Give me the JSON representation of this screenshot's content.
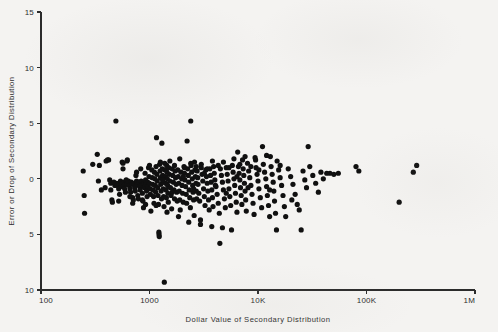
{
  "figure": {
    "background_color": "#f4f3f1",
    "ink_color": "#101010"
  },
  "chart_data": {
    "type": "scatter",
    "title": "",
    "xlabel": "Dollar Value of Secondary Distribution",
    "ylabel": "Error or Drop of Secondary Distribution",
    "xscale": "log",
    "yscale": "linear",
    "xlim": [
      100,
      1000000
    ],
    "ylim": [
      -10,
      15
    ],
    "grid": false,
    "legend": null,
    "xtick_labels": [
      "100",
      "1000",
      "10K",
      "100K",
      "1M"
    ],
    "xtick_values": [
      100,
      1000,
      10000,
      100000,
      1000000
    ],
    "ytick_labels": [
      "15",
      "10",
      "5",
      "0",
      "5",
      "10"
    ],
    "ytick_values": [
      15,
      10,
      5,
      0,
      -5,
      -10
    ],
    "marker": "filled-circle",
    "marker_size_px": 2.6,
    "n_points": 331,
    "points": [
      [
        245,
        0.7
      ],
      [
        250,
        -1.5
      ],
      [
        252,
        -3.1
      ],
      [
        330,
        2.2
      ],
      [
        338,
        -0.2
      ],
      [
        345,
        1.2
      ],
      [
        360,
        -1.0
      ],
      [
        398,
        1.6
      ],
      [
        410,
        1.7
      ],
      [
        420,
        1.7
      ],
      [
        430,
        -0.1
      ],
      [
        440,
        -0.4
      ],
      [
        450,
        -1.9
      ],
      [
        455,
        -2.1
      ],
      [
        470,
        -0.3
      ],
      [
        480,
        -0.6
      ],
      [
        490,
        5.2
      ],
      [
        500,
        -0.4
      ],
      [
        510,
        -0.6
      ],
      [
        520,
        -0.9
      ],
      [
        530,
        -1.4
      ],
      [
        540,
        -0.2
      ],
      [
        545,
        -0.5
      ],
      [
        550,
        -0.7
      ],
      [
        560,
        1.5
      ],
      [
        570,
        1.4
      ],
      [
        580,
        -0.3
      ],
      [
        585,
        -0.6
      ],
      [
        590,
        -0.9
      ],
      [
        600,
        -1.2
      ],
      [
        610,
        -0.1
      ],
      [
        615,
        -0.5
      ],
      [
        620,
        1.6
      ],
      [
        625,
        1.7
      ],
      [
        640,
        -0.2
      ],
      [
        650,
        -0.6
      ],
      [
        660,
        -0.9
      ],
      [
        670,
        -1.2
      ],
      [
        680,
        -0.3
      ],
      [
        690,
        -0.5
      ],
      [
        700,
        -1.7
      ],
      [
        710,
        -1.9
      ],
      [
        720,
        -0.4
      ],
      [
        730,
        -0.8
      ],
      [
        740,
        -1.1
      ],
      [
        750,
        0.3
      ],
      [
        760,
        -0.2
      ],
      [
        770,
        -0.5
      ],
      [
        780,
        -1.5
      ],
      [
        790,
        -1.8
      ],
      [
        800,
        -0.3
      ],
      [
        810,
        -0.7
      ],
      [
        820,
        -1.0
      ],
      [
        830,
        0.9
      ],
      [
        840,
        -0.2
      ],
      [
        850,
        -0.6
      ],
      [
        860,
        -1.3
      ],
      [
        870,
        -2.0
      ],
      [
        880,
        -2.6
      ],
      [
        890,
        -0.4
      ],
      [
        900,
        -0.8
      ],
      [
        910,
        0.5
      ],
      [
        920,
        -0.1
      ],
      [
        930,
        -0.5
      ],
      [
        940,
        -1.1
      ],
      [
        950,
        -1.6
      ],
      [
        960,
        -0.3
      ],
      [
        970,
        -0.7
      ],
      [
        980,
        1.0
      ],
      [
        990,
        0.2
      ],
      [
        1000,
        -0.4
      ],
      [
        1010,
        -0.9
      ],
      [
        1020,
        -1.4
      ],
      [
        1030,
        -2.9
      ],
      [
        1050,
        0.8
      ],
      [
        1060,
        0.1
      ],
      [
        1070,
        -0.5
      ],
      [
        1080,
        -1.0
      ],
      [
        1090,
        -1.6
      ],
      [
        1100,
        -2.2
      ],
      [
        1110,
        0.6
      ],
      [
        1120,
        0.0
      ],
      [
        1130,
        -0.6
      ],
      [
        1140,
        -1.2
      ],
      [
        1150,
        1.1
      ],
      [
        1160,
        3.7
      ],
      [
        1170,
        0.4
      ],
      [
        1180,
        -0.2
      ],
      [
        1190,
        -0.8
      ],
      [
        1200,
        -1.5
      ],
      [
        1210,
        -2.3
      ],
      [
        1220,
        -4.8
      ],
      [
        1225,
        -5.0
      ],
      [
        1230,
        -5.2
      ],
      [
        1240,
        1.3
      ],
      [
        1250,
        0.7
      ],
      [
        1260,
        0.1
      ],
      [
        1270,
        -0.5
      ],
      [
        1280,
        -1.1
      ],
      [
        1290,
        -1.8
      ],
      [
        1300,
        3.2
      ],
      [
        1310,
        0.9
      ],
      [
        1320,
        0.3
      ],
      [
        1330,
        -0.3
      ],
      [
        1340,
        -0.9
      ],
      [
        1350,
        -1.6
      ],
      [
        1360,
        -2.5
      ],
      [
        1370,
        -9.3
      ],
      [
        1380,
        1.4
      ],
      [
        1390,
        0.8
      ],
      [
        1400,
        0.2
      ],
      [
        1410,
        -0.4
      ],
      [
        1420,
        -1.0
      ],
      [
        1430,
        -1.7
      ],
      [
        1440,
        1.2
      ],
      [
        1450,
        0.6
      ],
      [
        1460,
        0.0
      ],
      [
        1470,
        -0.6
      ],
      [
        1480,
        -1.3
      ],
      [
        1490,
        -2.1
      ],
      [
        1500,
        1.0
      ],
      [
        1520,
        0.4
      ],
      [
        1540,
        -0.2
      ],
      [
        1560,
        -0.8
      ],
      [
        1580,
        -1.5
      ],
      [
        1600,
        -2.7
      ],
      [
        1620,
        0.9
      ],
      [
        1640,
        0.3
      ],
      [
        1660,
        -0.3
      ],
      [
        1680,
        -1.0
      ],
      [
        1700,
        -1.8
      ],
      [
        1720,
        0.7
      ],
      [
        1740,
        0.1
      ],
      [
        1760,
        -0.5
      ],
      [
        1780,
        -1.2
      ],
      [
        1800,
        -2.0
      ],
      [
        1820,
        0.8
      ],
      [
        1840,
        0.2
      ],
      [
        1860,
        -0.4
      ],
      [
        1880,
        -1.1
      ],
      [
        1900,
        -1.9
      ],
      [
        1920,
        -2.8
      ],
      [
        1950,
        0.6
      ],
      [
        1980,
        0.0
      ],
      [
        2000,
        -0.6
      ],
      [
        2020,
        -1.3
      ],
      [
        2050,
        -2.1
      ],
      [
        2080,
        1.1
      ],
      [
        2100,
        0.5
      ],
      [
        2120,
        -0.1
      ],
      [
        2150,
        -0.7
      ],
      [
        2180,
        -1.4
      ],
      [
        2200,
        -2.2
      ],
      [
        2220,
        3.4
      ],
      [
        2250,
        0.9
      ],
      [
        2280,
        0.3
      ],
      [
        2300,
        -0.3
      ],
      [
        2320,
        -1.0
      ],
      [
        2350,
        -1.7
      ],
      [
        2380,
        -2.6
      ],
      [
        2400,
        5.2
      ],
      [
        2420,
        1.2
      ],
      [
        2450,
        0.6
      ],
      [
        2480,
        0.0
      ],
      [
        2500,
        -0.6
      ],
      [
        2520,
        -1.2
      ],
      [
        2550,
        -1.9
      ],
      [
        2580,
        -3.3
      ],
      [
        2600,
        1.5
      ],
      [
        2620,
        0.8
      ],
      [
        2650,
        0.2
      ],
      [
        2680,
        -0.4
      ],
      [
        2700,
        -1.1
      ],
      [
        2720,
        -1.8
      ],
      [
        2750,
        0.7
      ],
      [
        2780,
        0.1
      ],
      [
        2800,
        -0.5
      ],
      [
        2850,
        -1.3
      ],
      [
        2900,
        -2.0
      ],
      [
        2950,
        -3.7
      ],
      [
        3000,
        1.0
      ],
      [
        3050,
        0.4
      ],
      [
        3100,
        -0.2
      ],
      [
        3150,
        -0.9
      ],
      [
        3200,
        -1.6
      ],
      [
        3250,
        -2.4
      ],
      [
        3300,
        0.8
      ],
      [
        3350,
        0.2
      ],
      [
        3400,
        -0.4
      ],
      [
        3450,
        -1.1
      ],
      [
        3500,
        -1.9
      ],
      [
        3550,
        -2.8
      ],
      [
        3600,
        0.9
      ],
      [
        3650,
        0.3
      ],
      [
        3700,
        -0.3
      ],
      [
        3750,
        -1.0
      ],
      [
        3800,
        -1.7
      ],
      [
        3850,
        -2.5
      ],
      [
        3900,
        1.1
      ],
      [
        3950,
        0.5
      ],
      [
        4000,
        -0.1
      ],
      [
        4100,
        -0.7
      ],
      [
        4200,
        -1.4
      ],
      [
        4300,
        -2.2
      ],
      [
        4400,
        -3.1
      ],
      [
        4450,
        -5.8
      ],
      [
        4500,
        0.9
      ],
      [
        4600,
        0.3
      ],
      [
        4700,
        -0.3
      ],
      [
        4800,
        -1.0
      ],
      [
        4900,
        -1.8
      ],
      [
        5000,
        -2.6
      ],
      [
        5100,
        1.0
      ],
      [
        5200,
        0.4
      ],
      [
        5300,
        -0.2
      ],
      [
        5400,
        -0.9
      ],
      [
        5500,
        -1.6
      ],
      [
        5600,
        -2.4
      ],
      [
        5700,
        -4.6
      ],
      [
        5800,
        1.2
      ],
      [
        5900,
        0.6
      ],
      [
        6000,
        0.0
      ],
      [
        6100,
        -0.6
      ],
      [
        6200,
        -1.3
      ],
      [
        6300,
        -2.1
      ],
      [
        6400,
        -3.0
      ],
      [
        6500,
        2.4
      ],
      [
        6600,
        1.1
      ],
      [
        6700,
        0.5
      ],
      [
        6800,
        -0.1
      ],
      [
        6900,
        -0.8
      ],
      [
        7000,
        -1.5
      ],
      [
        7100,
        -2.3
      ],
      [
        7200,
        1.7
      ],
      [
        7300,
        0.9
      ],
      [
        7400,
        0.3
      ],
      [
        7500,
        -0.4
      ],
      [
        7600,
        -1.1
      ],
      [
        7700,
        -1.9
      ],
      [
        7800,
        -2.9
      ],
      [
        8000,
        1.4
      ],
      [
        8200,
        0.7
      ],
      [
        8400,
        0.1
      ],
      [
        8600,
        -0.6
      ],
      [
        8800,
        -1.4
      ],
      [
        9000,
        -2.2
      ],
      [
        9200,
        -3.2
      ],
      [
        9400,
        1.9
      ],
      [
        9600,
        1.0
      ],
      [
        9800,
        0.4
      ],
      [
        10000,
        -0.2
      ],
      [
        10200,
        -0.9
      ],
      [
        10500,
        -1.7
      ],
      [
        10800,
        -2.6
      ],
      [
        11000,
        2.9
      ],
      [
        11200,
        1.3
      ],
      [
        11500,
        0.6
      ],
      [
        11800,
        0.0
      ],
      [
        12000,
        -0.7
      ],
      [
        12200,
        -1.5
      ],
      [
        12500,
        -2.4
      ],
      [
        12800,
        -3.4
      ],
      [
        13000,
        2.0
      ],
      [
        13200,
        1.1
      ],
      [
        13500,
        0.4
      ],
      [
        13800,
        -0.3
      ],
      [
        14000,
        -1.1
      ],
      [
        14200,
        -2.0
      ],
      [
        14500,
        -3.1
      ],
      [
        14800,
        -4.6
      ],
      [
        15000,
        1.6
      ],
      [
        15500,
        0.8
      ],
      [
        16000,
        0.1
      ],
      [
        16500,
        -0.6
      ],
      [
        17000,
        -1.5
      ],
      [
        17500,
        -2.5
      ],
      [
        18000,
        -3.4
      ],
      [
        19000,
        0.9
      ],
      [
        20000,
        0.2
      ],
      [
        21000,
        -0.5
      ],
      [
        22000,
        -1.4
      ],
      [
        23000,
        -2.3
      ],
      [
        24000,
        -2.8
      ],
      [
        25000,
        -4.6
      ],
      [
        26000,
        0.7
      ],
      [
        27000,
        -0.1
      ],
      [
        28000,
        -0.8
      ],
      [
        29000,
        2.9
      ],
      [
        30000,
        1.1
      ],
      [
        32000,
        0.3
      ],
      [
        34000,
        -0.4
      ],
      [
        36000,
        -1.2
      ],
      [
        38000,
        0.6
      ],
      [
        40000,
        0.0
      ],
      [
        43000,
        0.5
      ],
      [
        46000,
        0.5
      ],
      [
        50000,
        0.4
      ],
      [
        55000,
        0.5
      ],
      [
        80000,
        1.1
      ],
      [
        85000,
        0.7
      ],
      [
        200000,
        -2.1
      ],
      [
        270000,
        0.6
      ],
      [
        290000,
        1.2
      ],
      [
        440,
        -1.0
      ],
      [
        520,
        -2.0
      ],
      [
        700,
        -2.2
      ],
      [
        920,
        -2.3
      ],
      [
        1150,
        -2.4
      ],
      [
        1450,
        -3.0
      ],
      [
        1850,
        -3.4
      ],
      [
        2300,
        -3.9
      ],
      [
        2950,
        -4.1
      ],
      [
        3750,
        -4.3
      ],
      [
        4700,
        -4.4
      ],
      [
        1260,
        1.5
      ],
      [
        1540,
        1.6
      ],
      [
        1900,
        1.8
      ],
      [
        2400,
        1.4
      ],
      [
        3000,
        1.3
      ],
      [
        3800,
        1.6
      ],
      [
        4800,
        1.5
      ],
      [
        6000,
        1.8
      ],
      [
        7600,
        2.0
      ],
      [
        9500,
        1.7
      ],
      [
        12000,
        2.1
      ],
      [
        1700,
        1.2
      ],
      [
        2100,
        1.0
      ],
      [
        2700,
        1.1
      ],
      [
        3400,
        0.9
      ],
      [
        4300,
        1.2
      ],
      [
        5400,
        1.0
      ],
      [
        6800,
        1.3
      ],
      [
        8600,
        1.1
      ],
      [
        570,
        0.9
      ],
      [
        660,
        -1.6
      ],
      [
        760,
        0.6
      ],
      [
        860,
        -1.9
      ],
      [
        1000,
        1.2
      ],
      [
        1320,
        -0.1
      ],
      [
        1620,
        -1.2
      ],
      [
        2050,
        0.2
      ],
      [
        2550,
        -0.9
      ],
      [
        3200,
        0.5
      ],
      [
        4050,
        -0.6
      ],
      [
        5100,
        -1.3
      ],
      [
        6400,
        0.2
      ],
      [
        8100,
        -0.8
      ],
      [
        10200,
        0.8
      ],
      [
        12800,
        -1.0
      ],
      [
        16000,
        1.2
      ],
      [
        20500,
        -1.9
      ],
      [
        390,
        -0.8
      ],
      [
        300,
        1.3
      ]
    ]
  }
}
